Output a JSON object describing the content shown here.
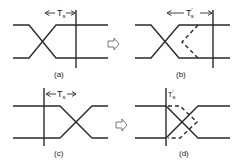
{
  "panels": [
    {
      "id": "a",
      "caption": "(a)",
      "label": "T",
      "label_sub": "s",
      "label_prime": ""
    },
    {
      "id": "b",
      "caption": "(b)",
      "label": "T",
      "label_sub": "s",
      "label_prime": "'"
    },
    {
      "id": "c",
      "caption": "(c)",
      "label": "T",
      "label_sub": "s",
      "label_prime": ""
    },
    {
      "id": "d",
      "caption": "(d)",
      "label": "T",
      "label_sub": "s",
      "label_prime": "'"
    }
  ],
  "arrows": [
    {
      "icon": "hollow-right-arrow-icon"
    },
    {
      "icon": "hollow-right-arrow-icon"
    }
  ],
  "colors": {
    "stroke": "#2a2a2a",
    "background": "#ffffff"
  }
}
